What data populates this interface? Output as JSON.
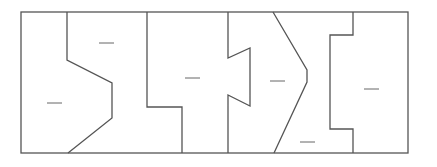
{
  "diagram": {
    "type": "partitioned-rectangle",
    "stroke_color": "#555555",
    "dash_color": "#666666",
    "background": "#ffffff",
    "outer_rect": {
      "x": 21,
      "y": 12,
      "width": 387,
      "height": 141
    },
    "dividers": [
      {
        "id": "divider-1",
        "points": "67,12 67,60 112,83 112,118 68,153"
      },
      {
        "id": "divider-2",
        "points": "147,12 147,107 182,107 182,153"
      },
      {
        "id": "divider-3",
        "points": "228,12 228,58 250,48 250,106 228,95 228,153"
      },
      {
        "id": "divider-4",
        "points": "273,12 307,70 307,82 274,153"
      },
      {
        "id": "divider-5",
        "points": "353,12 353,35 330,35 330,129 353,129 353,153"
      }
    ],
    "region_marks": [
      {
        "region": "region-1",
        "x1": 47,
        "y1": 103,
        "x2": 62,
        "y2": 103
      },
      {
        "region": "region-2",
        "x1": 99,
        "y1": 43,
        "x2": 114,
        "y2": 43
      },
      {
        "region": "region-3",
        "x1": 185,
        "y1": 78,
        "x2": 200,
        "y2": 78
      },
      {
        "region": "region-4",
        "x1": 270,
        "y1": 81,
        "x2": 285,
        "y2": 81
      },
      {
        "region": "region-5",
        "x1": 300,
        "y1": 142,
        "x2": 315,
        "y2": 142
      },
      {
        "region": "region-6",
        "x1": 364,
        "y1": 89,
        "x2": 379,
        "y2": 89
      }
    ]
  }
}
